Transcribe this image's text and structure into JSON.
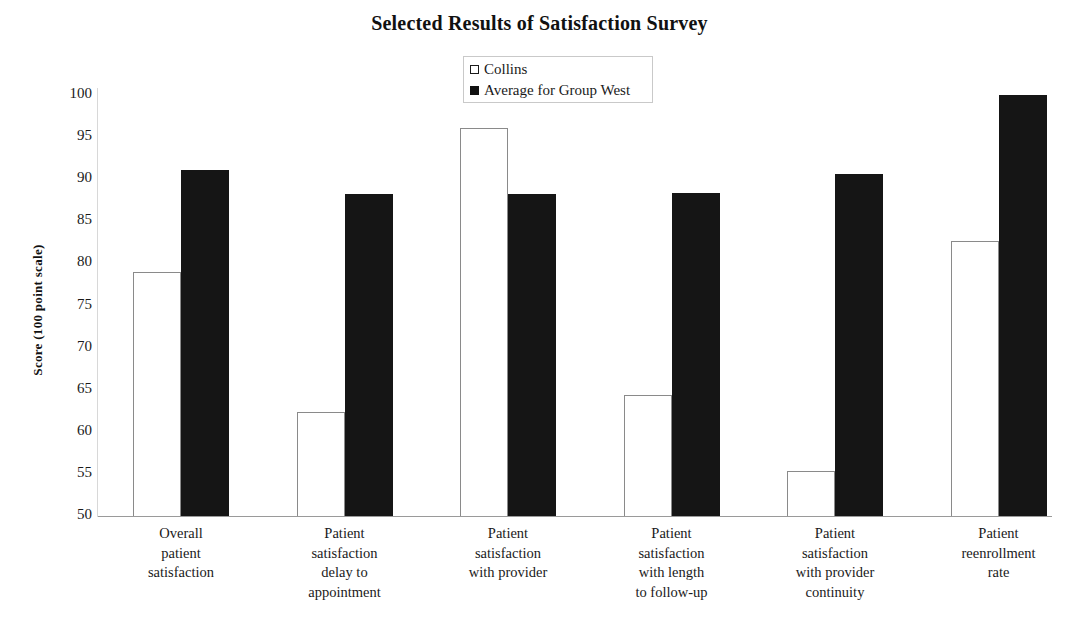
{
  "chart_data": {
    "type": "bar",
    "title": "Selected Results of Satisfaction Survey",
    "xlabel": "",
    "ylabel": "Score (100 point scale)",
    "ylim": [
      50,
      100
    ],
    "yticks": [
      100,
      95,
      90,
      85,
      80,
      75,
      70,
      65,
      60,
      55,
      50
    ],
    "grid": false,
    "legend_position": "top-center",
    "categories": [
      "Overall patient satisfaction",
      "Patient satisfaction delay to appointment",
      "Patient satisfaction with provider",
      "Patient satisfaction with length to follow-up",
      "Patient satisfaction with provider continuity",
      "Patient reenrollment rate"
    ],
    "category_lines": [
      [
        "Overall",
        "patient",
        "satisfaction"
      ],
      [
        "Patient",
        "satisfaction",
        "delay to",
        "appointment"
      ],
      [
        "Patient",
        "satisfaction",
        "with provider"
      ],
      [
        "Patient",
        "satisfaction",
        "with length",
        "to follow-up"
      ],
      [
        "Patient",
        "satisfaction",
        "with provider",
        "continuity"
      ],
      [
        "Patient",
        "reenrollment",
        "rate"
      ]
    ],
    "series": [
      {
        "name": "Collins",
        "color": "#ffffff",
        "edge_color": "#8a8a8a",
        "values": [
          79.0,
          62.3,
          96.1,
          64.4,
          55.4,
          82.7
        ]
      },
      {
        "name": "Average for Group West",
        "color": "#151515",
        "edge_color": "#151515",
        "values": [
          91.1,
          88.2,
          88.2,
          88.4,
          90.6,
          100.0
        ]
      }
    ]
  },
  "legend": {
    "items": [
      {
        "label": "Collins",
        "swatch": "hollow-square"
      },
      {
        "label": "Average for Group West",
        "swatch": "filled-square"
      }
    ]
  },
  "axis": {
    "y_ticks": [
      "100",
      "95",
      "90",
      "85",
      "80",
      "75",
      "70",
      "65",
      "60",
      "55",
      "50"
    ]
  }
}
